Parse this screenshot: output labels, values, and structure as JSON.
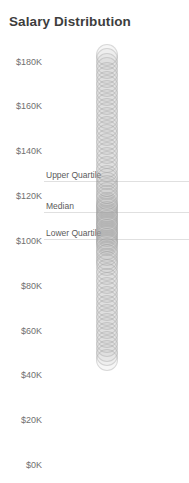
{
  "chart_data": {
    "type": "scatter",
    "title": "Salary Distribution",
    "xlabel": "",
    "ylabel": "",
    "ylim": [
      0,
      190000
    ],
    "grid": false,
    "legend": null,
    "y_ticks": [
      {
        "label": "$180K",
        "value": 180000
      },
      {
        "label": "$160K",
        "value": 160000
      },
      {
        "label": "$140K",
        "value": 140000
      },
      {
        "label": "$120K",
        "value": 120000
      },
      {
        "label": "$100K",
        "value": 100000
      },
      {
        "label": "$80K",
        "value": 80000
      },
      {
        "label": "$60K",
        "value": 60000
      },
      {
        "label": "$40K",
        "value": 40000
      },
      {
        "label": "$20K",
        "value": 20000
      },
      {
        "label": "$0K",
        "value": 0
      }
    ],
    "reference_lines": [
      {
        "label": "Upper Quartile",
        "value": 126500
      },
      {
        "label": "Median",
        "value": 113000
      },
      {
        "label": "Lower Quartile",
        "value": 101000
      }
    ],
    "values": [
      183000,
      181000,
      179000,
      177000,
      175000,
      173000,
      171000,
      169000,
      167000,
      165000,
      163000,
      161000,
      159000,
      157000,
      155000,
      153000,
      151000,
      149000,
      147000,
      145000,
      143000,
      141000,
      139000,
      137000,
      135000,
      133000,
      131000,
      129000,
      127500,
      126000,
      124500,
      123000,
      121500,
      120000,
      118500,
      117000,
      116000,
      115000,
      114000,
      113000,
      112000,
      111000,
      110000,
      109000,
      108000,
      107000,
      106000,
      105000,
      104000,
      103000,
      102000,
      101000,
      100000,
      99000,
      98000,
      96500,
      95000,
      93500,
      92000,
      90500,
      89000,
      87000,
      85000,
      83000,
      81000,
      79000,
      77000,
      75000,
      73000,
      71000,
      69000,
      67000,
      65000,
      63000,
      61000,
      59000,
      57000,
      55000,
      53000,
      51000,
      49000,
      47000
    ]
  }
}
